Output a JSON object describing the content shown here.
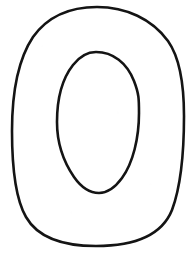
{
  "page": {
    "kind": "coloring-page-letter-template",
    "width": 193,
    "height": 256
  },
  "canvas": {
    "background_color": "#ffffff",
    "name": "drawing-canvas"
  },
  "artwork": {
    "glyph": "O",
    "description": "Hand-drawn outline of the letter O (ring shape) as a blank coloring / tracing template",
    "stroke_color": "#141414",
    "stroke_width": 2.6,
    "fill_color": "none",
    "outer_contour": {
      "name": "outer-outline",
      "label": "Outer edge of the letter O",
      "bounds": {
        "x": 11,
        "y": 6,
        "width": 174,
        "height": 241
      },
      "extremes": {
        "top": {
          "x": 97,
          "y": 7
        },
        "right": {
          "x": 184,
          "y": 116
        },
        "bottom": {
          "x": 96,
          "y": 246
        },
        "left": {
          "x": 12,
          "y": 131
        }
      },
      "path": "M 97 7 C 126 7 152 19 168 41 C 180 58 184 86 184 116 C 184 150 181 186 172 210 C 162 235 134 246 96 246 C 62 246 38 238 26 217 C 15 198 12 163 12 131 C 12 96 17 61 33 37 C 48 16 70 7 97 7 Z"
    },
    "inner_contour": {
      "name": "inner-outline",
      "label": "Inner counter (hole) of the letter O",
      "bounds": {
        "x": 57,
        "y": 52,
        "width": 82,
        "height": 142
      },
      "extremes": {
        "top": {
          "x": 96,
          "y": 52
        },
        "right": {
          "x": 139,
          "y": 110
        },
        "bottom": {
          "x": 99,
          "y": 193
        },
        "left": {
          "x": 57,
          "y": 126
        }
      },
      "path": "M 96 52 C 113 52 127 63 134 81 C 139 94 139 99 139 113 C 139 138 133 163 122 178 C 114 189 107 193 99 193 C 90 193 81 187 74 177 C 63 161 57 142 57 122 C 57 100 62 79 73 65 C 80 56 87 52 96 52 Z"
    }
  }
}
